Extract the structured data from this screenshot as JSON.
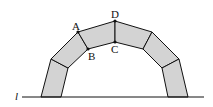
{
  "diagram": {
    "title": "",
    "ground_line_label": "l",
    "points": {
      "A": "A",
      "B": "B",
      "C": "C",
      "D": "D"
    },
    "colors": {
      "stone_fill": "#d3d3d3",
      "stroke": "#111111",
      "background": "#ffffff"
    },
    "stone_count": 6
  }
}
